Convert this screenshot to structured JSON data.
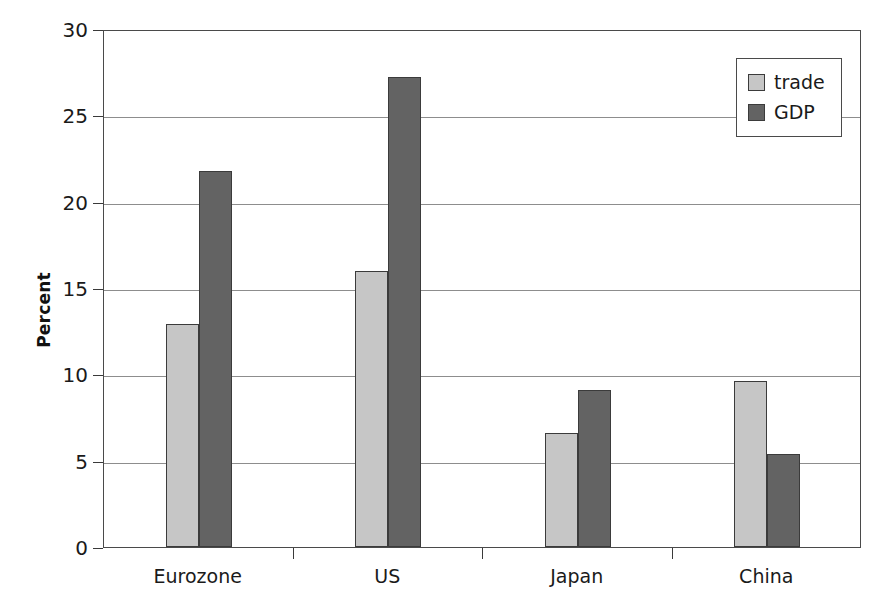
{
  "chart_data": {
    "type": "bar",
    "title": "",
    "xlabel": "",
    "ylabel": "Percent",
    "categories": [
      "Eurozone",
      "US",
      "Japan",
      "China"
    ],
    "series": [
      {
        "name": "trade",
        "color": "#c6c6c6",
        "values": [
          12.9,
          16.0,
          6.6,
          9.6
        ]
      },
      {
        "name": "GDP",
        "color": "#636363",
        "values": [
          21.8,
          27.2,
          9.1,
          5.4
        ]
      }
    ],
    "ylim": [
      0,
      30
    ],
    "ytick_values": [
      0,
      5,
      10,
      15,
      20,
      25,
      30
    ],
    "ytick_labels": [
      "0",
      "5",
      "10",
      "15",
      "20",
      "25",
      "30"
    ],
    "grid": true,
    "grid_axis": "y",
    "legend_position": "top-right",
    "legend_entries": [
      "trade",
      "GDP"
    ],
    "bar_outline_color": "#3b3b3b",
    "plot_border_color": "#4a4a4a",
    "background_color": "#ffffff"
  },
  "axes": {
    "y_label": "Percent"
  },
  "legend": {
    "items": [
      {
        "label": "trade",
        "swatch": "#c6c6c6"
      },
      {
        "label": "GDP",
        "swatch": "#636363"
      }
    ]
  }
}
